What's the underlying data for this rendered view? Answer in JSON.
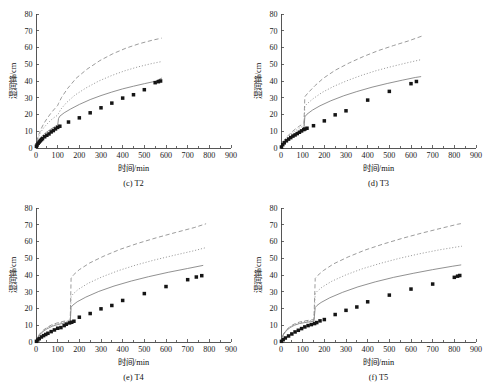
{
  "figure": {
    "panel_positions": [
      {
        "id": "c",
        "left": 0,
        "top": 0
      },
      {
        "id": "d",
        "left": 245,
        "top": 0
      },
      {
        "id": "e",
        "left": 0,
        "top": 194
      },
      {
        "id": "f",
        "left": 245,
        "top": 194
      }
    ],
    "colors": {
      "background": "#ffffff",
      "axis": "#444444",
      "curve_gray": "#8a8a8a",
      "marker": "#151515",
      "text": "#111111"
    }
  },
  "chart_data": [
    {
      "type": "scatter",
      "panel_id": "c",
      "title": "(c) T2",
      "xlabel": "时间/min",
      "ylabel": "湿润锋/cm",
      "xlim": [
        0,
        900
      ],
      "ylim": [
        0,
        80
      ],
      "xticks": [
        0,
        100,
        200,
        300,
        400,
        500,
        600,
        700,
        800,
        900
      ],
      "yticks": [
        0,
        10,
        20,
        30,
        40,
        50,
        60,
        70,
        80
      ],
      "grid": false,
      "legend_position": "none",
      "series": [
        {
          "name": "measured",
          "style": "markers",
          "marker": "square",
          "x": [
            2,
            5,
            10,
            15,
            20,
            25,
            30,
            40,
            50,
            60,
            70,
            80,
            90,
            100,
            110,
            150,
            200,
            250,
            300,
            350,
            400,
            450,
            500,
            550,
            565,
            575
          ],
          "y": [
            1.0,
            1.8,
            2.8,
            3.6,
            4.3,
            5.0,
            5.6,
            6.7,
            7.6,
            8.4,
            9.6,
            10.4,
            11.4,
            12.3,
            13.0,
            15.5,
            18.0,
            21.0,
            24.0,
            26.8,
            29.8,
            31.8,
            34.8,
            39.0,
            39.6,
            40.0
          ]
        },
        {
          "name": "model-solid",
          "style": "solid",
          "x": [
            0,
            5,
            12,
            22,
            35,
            50,
            70,
            90,
            100,
            104,
            110,
            130,
            160,
            200,
            250,
            300,
            350,
            400,
            450,
            500,
            550,
            580
          ],
          "y": [
            0,
            2.6,
            4.4,
            6.2,
            8.0,
            9.6,
            11.4,
            13.0,
            13.6,
            17.6,
            19.0,
            21.0,
            23.3,
            26.0,
            28.9,
            31.3,
            33.4,
            35.3,
            36.9,
            38.4,
            39.8,
            41.7
          ]
        },
        {
          "name": "model-dotted",
          "style": "dotted",
          "x": [
            0,
            5,
            12,
            22,
            35,
            50,
            70,
            90,
            100,
            104,
            115,
            140,
            180,
            230,
            290,
            350,
            410,
            470,
            530,
            580
          ],
          "y": [
            0,
            4.0,
            6.8,
            9.4,
            12.0,
            14.2,
            16.8,
            18.8,
            19.6,
            20.6,
            23.2,
            27.0,
            31.6,
            35.8,
            40.0,
            43.3,
            46.1,
            48.4,
            50.3,
            51.6
          ]
        },
        {
          "name": "model-dashed",
          "style": "dashed",
          "x": [
            0,
            5,
            12,
            22,
            35,
            50,
            70,
            90,
            100,
            104,
            118,
            145,
            185,
            235,
            295,
            355,
            415,
            475,
            535,
            580
          ],
          "y": [
            0,
            4.6,
            7.8,
            11.0,
            14.4,
            17.4,
            21.0,
            24.0,
            25.4,
            26.6,
            30.2,
            35.4,
            41.6,
            47.0,
            52.2,
            56.3,
            59.6,
            62.2,
            64.3,
            65.6
          ]
        }
      ]
    },
    {
      "type": "scatter",
      "panel_id": "d",
      "title": "(d) T3",
      "xlabel": "时间/min",
      "ylabel": "湿润锋/cm",
      "xlim": [
        0,
        900
      ],
      "ylim": [
        0,
        80
      ],
      "xticks": [
        0,
        100,
        200,
        300,
        400,
        500,
        600,
        700,
        800,
        900
      ],
      "yticks": [
        0,
        10,
        20,
        30,
        40,
        50,
        60,
        70,
        80
      ],
      "grid": false,
      "legend_position": "none",
      "series": [
        {
          "name": "measured",
          "style": "markers",
          "marker": "square",
          "x": [
            2,
            8,
            15,
            25,
            35,
            45,
            55,
            65,
            75,
            85,
            95,
            105,
            110,
            120,
            150,
            200,
            250,
            300,
            400,
            500,
            600,
            625
          ],
          "y": [
            0.6,
            2.0,
            3.1,
            4.3,
            5.3,
            6.2,
            7.1,
            7.8,
            8.6,
            9.4,
            10.2,
            11.0,
            11.3,
            11.8,
            13.3,
            16.2,
            19.8,
            22.2,
            28.6,
            33.8,
            38.4,
            39.7
          ]
        },
        {
          "name": "model-solid",
          "style": "solid",
          "x": [
            0,
            6,
            15,
            28,
            45,
            65,
            85,
            100,
            106,
            110,
            120,
            145,
            180,
            230,
            290,
            350,
            420,
            490,
            560,
            620,
            645
          ],
          "y": [
            0,
            2.0,
            3.6,
            5.3,
            7.0,
            8.6,
            10.0,
            11.0,
            11.4,
            18.6,
            20.2,
            22.6,
            25.2,
            28.2,
            31.2,
            33.7,
            36.3,
            38.5,
            40.5,
            42.1,
            42.6
          ]
        },
        {
          "name": "model-dotted",
          "style": "dotted",
          "x": [
            0,
            6,
            15,
            28,
            45,
            65,
            85,
            100,
            106,
            110,
            122,
            150,
            190,
            245,
            305,
            370,
            440,
            510,
            580,
            645
          ],
          "y": [
            0,
            2.4,
            4.2,
            6.2,
            8.2,
            10.2,
            11.9,
            13.0,
            13.5,
            25.0,
            26.6,
            29.6,
            33.2,
            36.9,
            40.2,
            43.3,
            46.2,
            48.6,
            50.8,
            52.7
          ]
        },
        {
          "name": "model-dashed",
          "style": "dashed",
          "x": [
            0,
            6,
            15,
            28,
            45,
            65,
            85,
            100,
            106,
            110,
            124,
            155,
            195,
            250,
            315,
            380,
            450,
            520,
            590,
            650
          ],
          "y": [
            0,
            2.6,
            4.6,
            6.8,
            9.0,
            11.2,
            13.1,
            14.3,
            14.9,
            30.6,
            32.8,
            37.0,
            41.6,
            46.4,
            50.8,
            54.6,
            58.2,
            61.2,
            64.0,
            66.8
          ]
        }
      ]
    },
    {
      "type": "scatter",
      "panel_id": "e",
      "title": "(e) T4",
      "xlabel": "时间/min",
      "ylabel": "湿润锋/cm",
      "xlim": [
        0,
        900
      ],
      "ylim": [
        0,
        80
      ],
      "xticks": [
        0,
        100,
        200,
        300,
        400,
        500,
        600,
        700,
        800,
        900
      ],
      "yticks": [
        0,
        10,
        20,
        30,
        40,
        50,
        60,
        70,
        80
      ],
      "grid": false,
      "legend_position": "none",
      "series": [
        {
          "name": "measured",
          "style": "markers",
          "marker": "square",
          "x": [
            2,
            8,
            15,
            25,
            35,
            45,
            55,
            70,
            85,
            100,
            115,
            130,
            140,
            155,
            165,
            175,
            200,
            250,
            300,
            350,
            400,
            500,
            600,
            700,
            740,
            765
          ],
          "y": [
            0.4,
            1.2,
            2.0,
            3.0,
            3.8,
            4.5,
            5.2,
            6.2,
            7.2,
            8.2,
            8.6,
            9.8,
            10.6,
            11.4,
            11.8,
            12.4,
            14.8,
            17.0,
            19.8,
            21.8,
            24.8,
            28.9,
            33.1,
            37.2,
            38.8,
            39.6
          ]
        },
        {
          "name": "model-solid",
          "style": "solid",
          "x": [
            0,
            6,
            15,
            30,
            50,
            75,
            100,
            125,
            150,
            158,
            162,
            170,
            190,
            230,
            290,
            360,
            440,
            520,
            610,
            700,
            770
          ],
          "y": [
            0,
            2.2,
            4.0,
            6.0,
            7.8,
            9.4,
            10.4,
            11.2,
            11.8,
            12.0,
            20.8,
            22.0,
            24.0,
            26.8,
            30.2,
            33.4,
            36.4,
            39.0,
            41.6,
            43.9,
            45.7
          ]
        },
        {
          "name": "model-dotted",
          "style": "dotted",
          "x": [
            0,
            6,
            15,
            30,
            50,
            75,
            100,
            125,
            150,
            158,
            162,
            172,
            195,
            240,
            305,
            380,
            460,
            545,
            635,
            720,
            780
          ],
          "y": [
            0,
            2.4,
            4.3,
            6.4,
            8.4,
            10.0,
            11.1,
            11.9,
            12.5,
            12.7,
            27.2,
            28.8,
            31.4,
            35.0,
            38.9,
            42.6,
            45.9,
            48.9,
            51.7,
            54.2,
            56.2
          ]
        },
        {
          "name": "model-dashed",
          "style": "dashed",
          "x": [
            0,
            6,
            15,
            30,
            50,
            75,
            100,
            125,
            150,
            158,
            162,
            174,
            200,
            248,
            315,
            390,
            470,
            555,
            645,
            730,
            785
          ],
          "y": [
            0,
            2.5,
            4.5,
            6.7,
            8.7,
            10.4,
            11.5,
            12.3,
            12.9,
            13.1,
            38.2,
            40.2,
            43.2,
            47.2,
            51.4,
            55.4,
            58.9,
            62.2,
            65.4,
            68.3,
            70.6
          ]
        }
      ]
    },
    {
      "type": "scatter",
      "panel_id": "f",
      "title": "(f) T5",
      "xlabel": "时间/min",
      "ylabel": "湿润锋/cm",
      "xlim": [
        0,
        900
      ],
      "ylim": [
        0,
        80
      ],
      "xticks": [
        0,
        100,
        200,
        300,
        400,
        500,
        600,
        700,
        800,
        900
      ],
      "yticks": [
        0,
        10,
        20,
        30,
        40,
        50,
        60,
        70,
        80
      ],
      "grid": false,
      "legend_position": "none",
      "series": [
        {
          "name": "measured",
          "style": "markers",
          "marker": "square",
          "x": [
            2,
            10,
            20,
            35,
            50,
            65,
            80,
            95,
            110,
            125,
            140,
            155,
            165,
            180,
            200,
            250,
            300,
            350,
            400,
            500,
            600,
            700,
            800,
            815,
            825
          ],
          "y": [
            0.4,
            1.4,
            2.4,
            3.6,
            4.8,
            6.0,
            7.0,
            8.0,
            9.0,
            9.8,
            10.4,
            11.0,
            11.6,
            12.6,
            13.4,
            16.4,
            18.9,
            20.9,
            24.0,
            28.0,
            31.6,
            34.6,
            38.6,
            39.3,
            39.7
          ]
        },
        {
          "name": "model-solid",
          "style": "solid",
          "x": [
            0,
            5,
            12,
            25,
            42,
            62,
            85,
            110,
            135,
            152,
            158,
            166,
            185,
            225,
            285,
            355,
            435,
            520,
            610,
            700,
            790,
            830
          ],
          "y": [
            0,
            2.6,
            4.6,
            6.8,
            8.6,
            10.0,
            11.0,
            11.6,
            12.1,
            12.4,
            20.6,
            21.8,
            23.6,
            26.4,
            29.7,
            32.9,
            35.9,
            38.6,
            41.0,
            43.2,
            45.2,
            46.0
          ]
        },
        {
          "name": "model-dotted",
          "style": "dotted",
          "x": [
            0,
            5,
            12,
            25,
            42,
            62,
            85,
            110,
            135,
            152,
            158,
            168,
            190,
            235,
            300,
            375,
            460,
            548,
            640,
            730,
            810,
            835
          ],
          "y": [
            0,
            2.7,
            4.8,
            7.1,
            9.0,
            10.5,
            11.5,
            12.2,
            12.7,
            13.0,
            29.0,
            30.4,
            32.8,
            36.3,
            40.1,
            43.7,
            47.0,
            50.0,
            52.7,
            55.0,
            56.7,
            57.2
          ]
        },
        {
          "name": "model-dashed",
          "style": "dashed",
          "x": [
            0,
            5,
            12,
            25,
            42,
            62,
            85,
            110,
            135,
            152,
            158,
            170,
            195,
            242,
            310,
            388,
            472,
            560,
            652,
            742,
            815,
            840
          ],
          "y": [
            0,
            2.8,
            4.9,
            7.3,
            9.3,
            10.8,
            11.9,
            12.6,
            13.1,
            13.4,
            38.0,
            39.8,
            42.6,
            46.6,
            50.8,
            54.9,
            58.5,
            61.9,
            65.1,
            68.0,
            70.3,
            70.9
          ]
        }
      ]
    }
  ]
}
